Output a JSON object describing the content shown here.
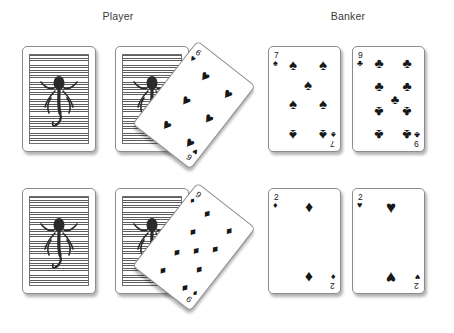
{
  "figure": {
    "type": "playing-card-illustration",
    "background_color": "#ffffff",
    "ink_color": "#171717",
    "card_back_color": "#5d5d5d"
  },
  "labels": {
    "player": "Player",
    "banker": "Banker"
  },
  "rows": [
    {
      "row_name": "first-hand",
      "player": [
        {
          "position": 1,
          "state": "face-down",
          "back_motif": "octopus-icon",
          "rotation_deg": 0
        },
        {
          "position": 2,
          "state": "face-down",
          "back_motif": "octopus-icon",
          "rotation_deg": 0
        },
        {
          "position": 3,
          "state": "face-up",
          "rank": "6",
          "suit": "hearts",
          "suit_glyph": "♥",
          "rotation_deg": 38,
          "pip_count": 6
        }
      ],
      "banker": [
        {
          "position": 1,
          "state": "face-up",
          "rank": "7",
          "suit": "spades",
          "suit_glyph": "♠",
          "rotation_deg": 0,
          "pip_count": 7
        },
        {
          "position": 2,
          "state": "face-up",
          "rank": "9",
          "suit": "clubs",
          "suit_glyph": "♣",
          "rotation_deg": 0,
          "pip_count": 9
        }
      ]
    },
    {
      "row_name": "second-hand",
      "player": [
        {
          "position": 1,
          "state": "face-down",
          "back_motif": "octopus-icon",
          "rotation_deg": 0
        },
        {
          "position": 2,
          "state": "face-down",
          "back_motif": "octopus-icon",
          "rotation_deg": 0
        },
        {
          "position": 3,
          "state": "face-up",
          "rank": "9",
          "suit": "diamonds",
          "suit_glyph": "♦",
          "rotation_deg": 38,
          "pip_count": 9
        }
      ],
      "banker": [
        {
          "position": 1,
          "state": "face-up",
          "rank": "2",
          "suit": "diamonds",
          "suit_glyph": "♦",
          "rotation_deg": 0,
          "pip_count": 2
        },
        {
          "position": 2,
          "state": "face-up",
          "rank": "2",
          "suit": "hearts",
          "suit_glyph": "♥",
          "rotation_deg": 0,
          "pip_count": 2
        }
      ]
    }
  ],
  "cards": {
    "r1_player_6h": {
      "rank": "6",
      "suit_glyph": "♥"
    },
    "r1_banker_7s": {
      "rank": "7",
      "suit_glyph": "♠"
    },
    "r1_banker_9c": {
      "rank": "9",
      "suit_glyph": "♣"
    },
    "r2_player_9d": {
      "rank": "9",
      "suit_glyph": "♦"
    },
    "r2_banker_2d": {
      "rank": "2",
      "suit_glyph": "♦"
    },
    "r2_banker_2h": {
      "rank": "2",
      "suit_glyph": "♥"
    }
  }
}
